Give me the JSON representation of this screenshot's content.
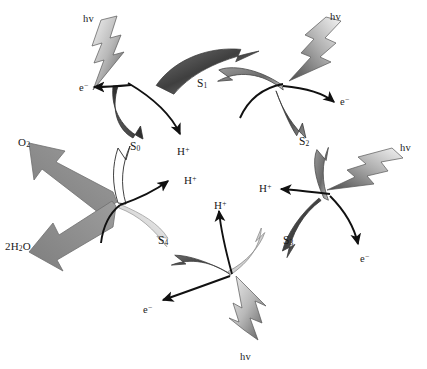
{
  "diagram": {
    "name": "kok-cycle",
    "background": "#ffffff",
    "stroke_color": "#111111",
    "arrow_fill": "#8a8a8a",
    "ribbon_dark": "#5a5a5a",
    "ribbon_light": "#d8d8d8"
  },
  "states": [
    {
      "id": "S0",
      "label": "S",
      "sub": "0",
      "x": 130,
      "y": 141
    },
    {
      "id": "S1",
      "label": "S",
      "sub": "1",
      "x": 197,
      "y": 78
    },
    {
      "id": "S2",
      "label": "S",
      "sub": "2",
      "x": 299,
      "y": 136
    },
    {
      "id": "S3",
      "label": "S",
      "sub": "3",
      "x": 283,
      "y": 235
    },
    {
      "id": "S4",
      "label": "S",
      "sub": "4",
      "x": 158,
      "y": 235
    }
  ],
  "photons": [
    {
      "id": "hv-s1",
      "label": "hv",
      "x": 83,
      "y": 14
    },
    {
      "id": "hv-s2",
      "label": "hv",
      "x": 330,
      "y": 12
    },
    {
      "id": "hv-s3",
      "label": "hv",
      "x": 400,
      "y": 143
    },
    {
      "id": "hv-s4",
      "label": "hv",
      "x": 240,
      "y": 352
    }
  ],
  "electrons": [
    {
      "id": "e-s1",
      "label": "e",
      "sup": "−",
      "x": 79,
      "y": 82
    },
    {
      "id": "e-s2",
      "label": "e",
      "sup": "−",
      "x": 340,
      "y": 96
    },
    {
      "id": "e-s3",
      "label": "e",
      "sup": "−",
      "x": 360,
      "y": 253
    },
    {
      "id": "e-s4",
      "label": "e",
      "sup": "−",
      "x": 143,
      "y": 304
    }
  ],
  "protons": [
    {
      "id": "h-s1",
      "label": "H",
      "sup": "+",
      "x": 177,
      "y": 146
    },
    {
      "id": "h-s0",
      "label": "H",
      "sup": "+",
      "x": 184,
      "y": 175
    },
    {
      "id": "h-s3",
      "label": "H",
      "sup": "+",
      "x": 259,
      "y": 183
    },
    {
      "id": "h-s4",
      "label": "H",
      "sup": "+",
      "x": 214,
      "y": 200
    }
  ],
  "substrates": [
    {
      "id": "o2-out",
      "label": "O",
      "sub": "2",
      "x": 18,
      "y": 137,
      "role": "product"
    },
    {
      "id": "water-in",
      "label": "2H",
      "sub": "2",
      "tail": "O",
      "x": 5,
      "y": 241,
      "role": "reactant"
    }
  ],
  "colors": {
    "text": "#1a1a1a",
    "thick_arrow": "#8d8d8d",
    "thick_arrow_edge": "#6f6f6f"
  }
}
